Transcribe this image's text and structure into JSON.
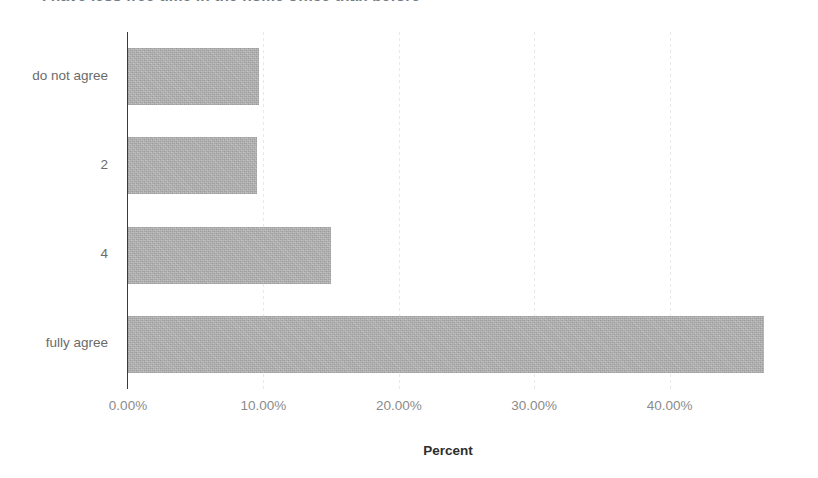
{
  "chart_data": {
    "type": "bar",
    "orientation": "horizontal",
    "title": "I have less free time in the home office than before",
    "title_clipped": true,
    "categories": [
      "do not agree",
      "2",
      "4",
      "fully agree"
    ],
    "values": [
      9.7,
      9.5,
      15.0,
      47.0
    ],
    "value_labels": [
      "9.70%",
      "9.50%",
      "15.00%",
      "47.00%"
    ],
    "xlabel": "Percent",
    "ylabel": "",
    "xlim": [
      0,
      48.6
    ],
    "xticks": [
      0,
      10,
      20,
      30,
      40
    ],
    "xtick_labels": [
      "0.00%",
      "10.00%",
      "20.00%",
      "30.00%",
      "40.00%"
    ],
    "grid": true,
    "grid_axis": "x",
    "legend": false,
    "bar_color": "#b5b5b5",
    "axis_color": "#3a3a3a",
    "grid_color": "#e8e8e8",
    "tick_label_color": "#8b8b8b",
    "axis_title_color": "#2e2e2e"
  },
  "axis": {
    "x_title": "Percent"
  }
}
